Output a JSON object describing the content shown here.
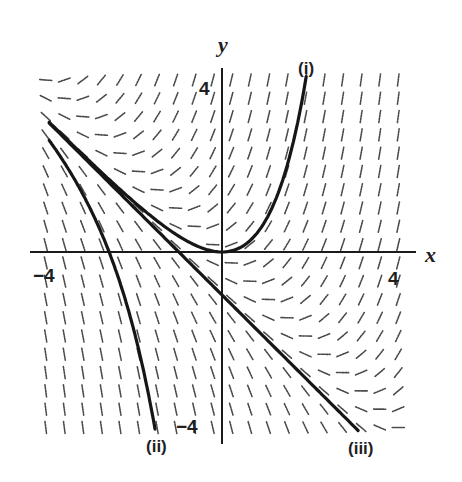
{
  "figure": {
    "axis_labels": {
      "x": "x",
      "y": "y"
    },
    "tick_labels": {
      "x_neg": "−4",
      "x_pos": "4",
      "y_pos": "4",
      "y_neg": "−4"
    },
    "curve_labels": {
      "i": "(i)",
      "ii": "(ii)",
      "iii": "(iii)"
    }
  },
  "chart_data": {
    "type": "slope_field",
    "title": "",
    "equation": "dy/dx = x + y",
    "xlabel": "x",
    "ylabel": "y",
    "xlim": [
      -4.5,
      4.5
    ],
    "ylim": [
      -4.5,
      4.5
    ],
    "tick_labels": {
      "x": [
        -4,
        4
      ],
      "y": [
        -4,
        4
      ]
    },
    "grid": {
      "columns": 20,
      "rows": 20,
      "x_range": [
        -4.08,
        4.08
      ],
      "y_range": [
        -4.08,
        4.0
      ],
      "segment_length": 0.28
    },
    "solution_curves": [
      {
        "label": "(i)",
        "formula": "y = e^x - x - 1",
        "C": 1,
        "x_range": [
          -4,
          1.95
        ]
      },
      {
        "label": "(ii)",
        "formula": "y = C e^x - x - 1",
        "C": -22,
        "x_range": [
          -4,
          -1.55
        ]
      },
      {
        "label": "(iii)",
        "formula": "y = -x - 1",
        "C": 0,
        "x_range": [
          -4,
          3.15
        ]
      }
    ]
  }
}
